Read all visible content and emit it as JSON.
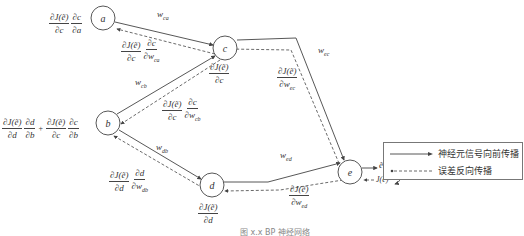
{
  "nodes": {
    "a": "a",
    "b": "b",
    "c": "c",
    "d": "d",
    "e": "e"
  },
  "weights": {
    "w_ca": "w",
    "w_ca_sub": "ca",
    "w_cb": "w",
    "w_cb_sub": "cb",
    "w_db": "w",
    "w_db_sub": "db",
    "w_ec": "w",
    "w_ec_sub": "ec",
    "w_ed": "w",
    "w_ed_sub": "ed"
  },
  "gradients": {
    "a": {
      "n1": "∂J(ẽ)",
      "d1": "∂c",
      "n2": "∂c",
      "d2": "∂a"
    },
    "w_ca": {
      "n1": "∂J(ẽ)",
      "d1": "∂c",
      "n2": "∂c",
      "d2": "∂w",
      "d2_sub": "ca"
    },
    "c": {
      "n1": "∂J(ẽ)",
      "d1": "∂c"
    },
    "w_cb": {
      "n1": "∂J(ẽ)",
      "d1": "∂c",
      "n2": "∂c",
      "d2": "∂w",
      "d2_sub": "cb"
    },
    "b": {
      "n1": "∂J(ẽ)",
      "d1": "∂d",
      "n2": "∂d",
      "d2": "∂b",
      "plus": "+",
      "n3": "∂J(ẽ)",
      "d3": "∂c",
      "n4": "∂c",
      "d4": "∂b"
    },
    "w_db": {
      "n1": "∂J(ẽ)",
      "d1": "∂d",
      "n2": "∂d",
      "d2": "∂w",
      "d2_sub": "db"
    },
    "d": {
      "n1": "∂J(ẽ)",
      "d1": "∂d"
    },
    "w_ec": {
      "n1": "∂J(ẽ)",
      "d1": "∂w",
      "d1_sub": "ec"
    },
    "w_ed": {
      "n1": "∂J(ẽ)",
      "d1": "∂w",
      "d1_sub": "ed"
    }
  },
  "output": {
    "e_tilde": "ẽ",
    "J": "J(ẽ)"
  },
  "legend": {
    "forward": "神经元信号向前传播",
    "backward": "误差反向传播"
  },
  "caption": "图 x.x  BP 神经网络",
  "colors": {
    "line": "#444444",
    "legend_border": "#777777"
  }
}
